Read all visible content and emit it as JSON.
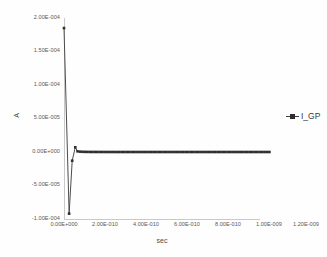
{
  "chart_data": {
    "type": "line",
    "title": "",
    "xlabel": "sec",
    "ylabel": "A",
    "xlim": [
      0,
      1.2e-09
    ],
    "ylim": [
      -0.0001,
      0.0002
    ],
    "grid": false,
    "legend_position": "right",
    "x_tick_labels": [
      "0.00E+000",
      "2.00E-010",
      "4.00E-010",
      "6.00E-010",
      "8.00E-010",
      "1.00E-009",
      "1.20E-009"
    ],
    "x_tick_values": [
      0,
      2e-10,
      4e-10,
      6e-10,
      8e-10,
      1e-09,
      1.2e-09
    ],
    "y_tick_labels": [
      "2.00E-004",
      "1.50E-004",
      "1.00E-004",
      "5.00E-005",
      "0.00E+000",
      "-5.00E-005",
      "-1.00E-004"
    ],
    "y_tick_values": [
      0.0002,
      0.00015,
      0.0001,
      5e-05,
      0.0,
      -5e-05,
      -0.0001
    ],
    "series": [
      {
        "name": "I_GP",
        "marker": "square",
        "color": "#4c4c4c",
        "x": [
          0.0,
          2.5e-11,
          4e-11,
          5.5e-11,
          6.6e-11,
          7.8e-11,
          9e-11,
          1.02e-10,
          1.14e-10,
          1.26e-10,
          1.38e-10,
          1.5e-10,
          1.62e-10,
          1.74e-10,
          1.86e-10,
          1.98e-10,
          2.1e-10,
          2.22e-10,
          2.34e-10,
          2.46e-10,
          2.58e-10,
          2.7e-10,
          2.82e-10,
          2.94e-10,
          3.06e-10,
          3.18e-10,
          3.3e-10,
          3.42e-10,
          3.54e-10,
          3.66e-10,
          3.78e-10,
          3.9e-10,
          4.02e-10,
          4.14e-10,
          4.26e-10,
          4.38e-10,
          4.5e-10,
          4.62e-10,
          4.74e-10,
          4.86e-10,
          4.98e-10,
          5.1e-10,
          5.22e-10,
          5.34e-10,
          5.46e-10,
          5.58e-10,
          5.7e-10,
          5.82e-10,
          5.94e-10,
          6.06e-10,
          6.18e-10,
          6.3e-10,
          6.42e-10,
          6.54e-10,
          6.66e-10,
          6.78e-10,
          6.9e-10,
          7.02e-10,
          7.14e-10,
          7.26e-10,
          7.38e-10,
          7.5e-10,
          7.62e-10,
          7.74e-10,
          7.86e-10,
          7.98e-10,
          8.1e-10,
          8.22e-10,
          8.34e-10,
          8.46e-10,
          8.58e-10,
          8.7e-10,
          8.82e-10,
          8.94e-10,
          9.06e-10,
          9.18e-10,
          9.3e-10,
          9.42e-10,
          9.54e-10,
          9.66e-10,
          9.78e-10,
          9.9e-10,
          1.002e-09
        ],
        "y": [
          0.000185,
          -9.2e-05,
          -1.3e-05,
          7e-06,
          1e-06,
          5e-07,
          3e-07,
          2e-07,
          1.5e-07,
          1e-07,
          8e-08,
          6e-08,
          5e-08,
          4e-08,
          3e-08,
          2e-08,
          1.5e-08,
          1e-08,
          8e-09,
          6e-09,
          5e-09,
          4e-09,
          3e-09,
          2e-09,
          1.5e-09,
          1e-09,
          8e-10,
          6e-10,
          5e-10,
          4e-10,
          3e-10,
          2e-10,
          1.5e-10,
          1e-10,
          8e-11,
          6e-11,
          5e-11,
          4e-11,
          3e-11,
          2e-11,
          1.5e-11,
          1e-11,
          8e-12,
          6e-12,
          5e-12,
          4e-12,
          3e-12,
          2e-12,
          1.5e-12,
          1e-12,
          8e-13,
          6e-13,
          5e-13,
          4e-13,
          3e-13,
          2e-13,
          1.5e-13,
          1e-13,
          8e-14,
          6e-14,
          5e-14,
          4e-14,
          3e-14,
          2e-14,
          1.5e-14,
          1e-14,
          8e-15,
          6e-15,
          5e-15,
          4e-15,
          3e-15,
          2e-15,
          1.5e-15,
          1e-15,
          8e-16,
          6e-16,
          5e-16,
          4e-16,
          3e-16,
          2e-16,
          1.5e-16,
          1e-16,
          0.0
        ]
      }
    ]
  },
  "legend": {
    "entries": [
      {
        "label": "I_GP"
      }
    ]
  }
}
